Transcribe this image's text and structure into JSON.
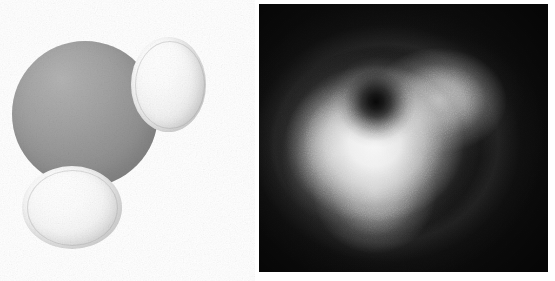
{
  "figure": {
    "width": 555,
    "height": 281,
    "background_color": "#ffffff",
    "caption": ""
  },
  "molecule_panel": {
    "name": "water-molecule-model",
    "label": "",
    "background_color": "#ffffff",
    "render_style": "space-filling",
    "atoms": [
      {
        "element": "O",
        "name": "oxygen",
        "label": "",
        "color": "#969696",
        "highlight_color": "#b4b4b4",
        "radius_px": 73,
        "center_x": 85,
        "center_y": 114
      },
      {
        "element": "H",
        "name": "hydrogen-1",
        "label": "",
        "color": "#f2f2f2",
        "highlight_color": "#ffffff",
        "radius_px": 42,
        "center_x": 168,
        "center_y": 84
      },
      {
        "element": "H",
        "name": "hydrogen-2",
        "label": "",
        "color": "#f2f2f2",
        "highlight_color": "#ffffff",
        "radius_px": 44,
        "center_x": 72,
        "center_y": 207
      }
    ]
  },
  "density_panel": {
    "name": "electron-density-map",
    "label": "",
    "background_color": "#0d0d0d",
    "colormap": "greyscale",
    "low_color": "#000000",
    "high_color": "#ffffff",
    "frame": {
      "x": 259,
      "y": 4,
      "width": 289,
      "height": 268
    }
  },
  "chart_data": {
    "type": "heatmap",
    "title": "",
    "xlabel": "",
    "ylabel": "",
    "colormap": "gray",
    "grid": false,
    "legend": null,
    "xlim": [
      0,
      289
    ],
    "ylim": [
      0,
      268
    ],
    "tick_labels_x": [],
    "tick_labels_y": [],
    "annotations": [],
    "features": [
      {
        "name": "bright-lobe",
        "shape": "rounded-triangle",
        "center_x_frac": 0.42,
        "center_y_frac": 0.52,
        "intensity": 1.0
      },
      {
        "name": "radial-node",
        "shape": "circular-hole",
        "center_x_frac": 0.405,
        "center_y_frac": 0.365,
        "radius_frac": 0.16,
        "intensity": 0.02
      },
      {
        "name": "background-field",
        "shape": "full-frame",
        "intensity": 0.05
      }
    ],
    "values_note": "greyscale intensity, 0 = black (node / background), 1 = white (density maximum)",
    "intensity_grid": [
      [
        0.04,
        0.04,
        0.05,
        0.06,
        0.07,
        0.07,
        0.06,
        0.05,
        0.04,
        0.04
      ],
      [
        0.05,
        0.06,
        0.09,
        0.16,
        0.26,
        0.3,
        0.24,
        0.13,
        0.06,
        0.04
      ],
      [
        0.05,
        0.09,
        0.22,
        0.48,
        0.68,
        0.7,
        0.56,
        0.28,
        0.1,
        0.05
      ],
      [
        0.06,
        0.14,
        0.45,
        0.6,
        0.42,
        0.72,
        0.78,
        0.44,
        0.14,
        0.05
      ],
      [
        0.07,
        0.18,
        0.55,
        0.28,
        0.06,
        0.58,
        0.86,
        0.52,
        0.16,
        0.06
      ],
      [
        0.07,
        0.2,
        0.6,
        0.44,
        0.4,
        0.82,
        0.8,
        0.46,
        0.14,
        0.05
      ],
      [
        0.07,
        0.19,
        0.58,
        0.78,
        0.86,
        0.88,
        0.62,
        0.3,
        0.1,
        0.05
      ],
      [
        0.06,
        0.15,
        0.44,
        0.72,
        0.82,
        0.7,
        0.38,
        0.16,
        0.07,
        0.04
      ],
      [
        0.05,
        0.09,
        0.22,
        0.42,
        0.5,
        0.38,
        0.18,
        0.08,
        0.05,
        0.04
      ],
      [
        0.04,
        0.05,
        0.08,
        0.14,
        0.17,
        0.13,
        0.07,
        0.05,
        0.04,
        0.04
      ]
    ]
  }
}
